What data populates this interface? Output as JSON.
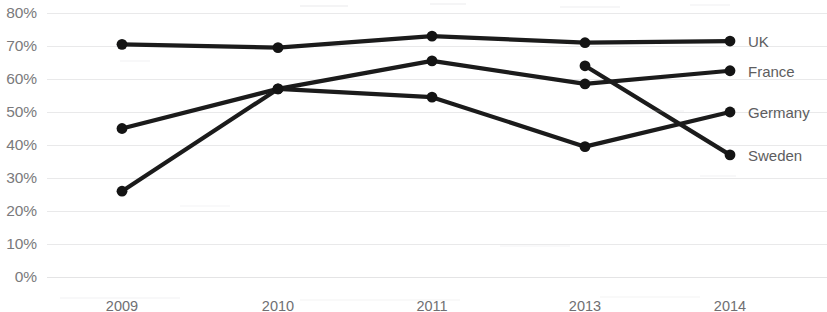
{
  "chart_data": {
    "type": "line",
    "title": "",
    "subtitle": "",
    "xlabel": "",
    "ylabel": "",
    "categories": [
      "2009",
      "2010",
      "2011",
      "2013",
      "2014"
    ],
    "ylim": [
      0,
      80
    ],
    "ytick_labels": [
      "0%",
      "10%",
      "20%",
      "30%",
      "40%",
      "50%",
      "60%",
      "70%",
      "80%"
    ],
    "ytick_values": [
      0,
      10,
      20,
      30,
      40,
      50,
      60,
      70,
      80
    ],
    "grid": true,
    "legend_position": "right-inline",
    "line_color": "#1b1b1b",
    "marker_color": "#141414",
    "grid_color": "#e9e9ea",
    "axis_text_color": "#7a7a7c",
    "series": [
      {
        "name": "UK",
        "values": [
          70.5,
          69.5,
          73,
          71,
          71.5
        ],
        "x": [
          "2009",
          "2010",
          "2011",
          "2013",
          "2014"
        ]
      },
      {
        "name": "France",
        "values": [
          45,
          57,
          65.5,
          58.5,
          62.5
        ],
        "x": [
          "2009",
          "2010",
          "2011",
          "2013",
          "2014"
        ]
      },
      {
        "name": "Germany",
        "values": [
          26,
          57,
          54.5,
          39.5,
          50
        ],
        "x": [
          "2009",
          "2010",
          "2011",
          "2013",
          "2014"
        ]
      },
      {
        "name": "Sweden",
        "values": [
          null,
          null,
          null,
          64,
          37
        ],
        "x": [
          "2009",
          "2010",
          "2011",
          "2013",
          "2014"
        ]
      }
    ],
    "series_label_positions": [
      {
        "name": "UK",
        "value": 71.5
      },
      {
        "name": "France",
        "value": 62.5
      },
      {
        "name": "Germany",
        "value": 50
      },
      {
        "name": "Sweden",
        "value": 37
      }
    ]
  }
}
